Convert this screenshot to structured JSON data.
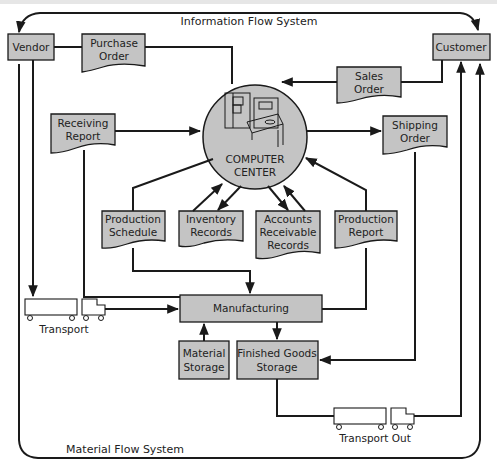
{
  "diagram": {
    "title_top": "Information Flow System",
    "title_bottom": "Material Flow System",
    "center": {
      "line1": "COMPUTER",
      "line2": "CENTER",
      "icon": "computer-terminal-icon"
    },
    "entities": {
      "vendor": "Vendor",
      "customer": "Customer",
      "manufacturing": "Manufacturing",
      "material_storage": {
        "line1": "Material",
        "line2": "Storage"
      },
      "finished_goods_storage": {
        "line1": "Finished Goods",
        "line2": "Storage"
      }
    },
    "documents": {
      "purchase_order": {
        "line1": "Purchase",
        "line2": "Order"
      },
      "sales_order": {
        "line1": "Sales",
        "line2": "Order"
      },
      "receiving_report": {
        "line1": "Receiving",
        "line2": "Report"
      },
      "shipping_order": {
        "line1": "Shipping",
        "line2": "Order"
      },
      "production_schedule": {
        "line1": "Production",
        "line2": "Schedule"
      },
      "inventory_records": {
        "line1": "Inventory",
        "line2": "Records"
      },
      "accounts_receivable_records": {
        "line1": "Accounts",
        "line2": "Receivable",
        "line3": "Records"
      },
      "production_report": {
        "line1": "Production",
        "line2": "Report"
      }
    },
    "transports": {
      "inbound": "Transport",
      "outbound": "Transport Out"
    },
    "colors": {
      "fill": "#c4c4c4",
      "stroke": "#1a1a1a",
      "background": "#ffffff"
    }
  }
}
